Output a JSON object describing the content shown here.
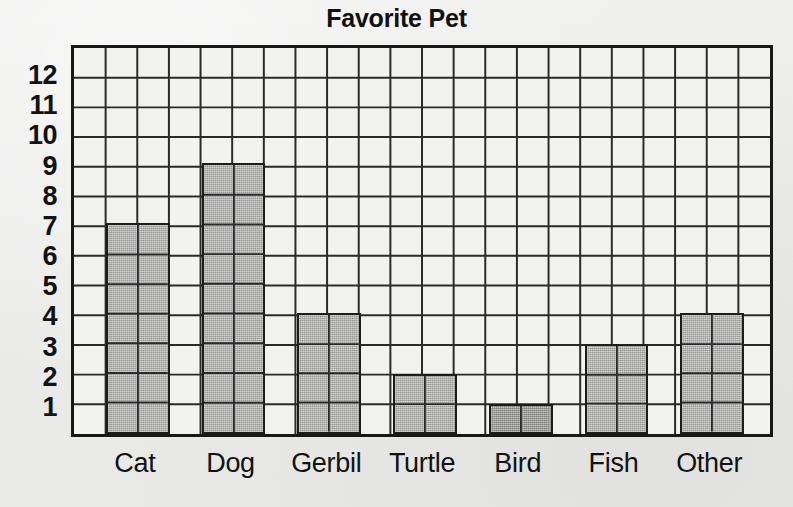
{
  "chart_data": {
    "type": "bar",
    "title": "Favorite Pet",
    "xlabel": "",
    "ylabel": "",
    "categories": [
      "Cat",
      "Dog",
      "Gerbil",
      "Turtle",
      "Bird",
      "Fish",
      "Other"
    ],
    "values": [
      7,
      9,
      4,
      2,
      1,
      3,
      4
    ],
    "ylim": [
      0,
      13
    ],
    "ytick_labels": [
      "1",
      "2",
      "3",
      "4",
      "5",
      "6",
      "7",
      "8",
      "9",
      "10",
      "11",
      "12"
    ],
    "ytick_values": [
      1,
      2,
      3,
      4,
      5,
      6,
      7,
      8,
      9,
      10,
      11,
      12
    ],
    "grid": true,
    "grid_columns": 22,
    "grid_rows": 13,
    "legend": null,
    "bar_width_columns": 2,
    "bar_gap_columns": 1,
    "colors": {
      "bar_fill": "#a9a9a7",
      "bar_fill_dark": "#8d8d8b",
      "bar_outline": "#1d1d1d",
      "grid_line": "#2a2a2a",
      "plot_background": "#f2f2f1",
      "page_background": "#ececeb",
      "text": "#121212"
    },
    "series": [
      {
        "name": "Favorite Pet",
        "values": [
          7,
          9,
          4,
          2,
          1,
          3,
          4
        ],
        "shades": [
          "normal",
          "normal",
          "normal",
          "normal",
          "dark",
          "normal",
          "normal"
        ]
      }
    ],
    "annotations": []
  }
}
